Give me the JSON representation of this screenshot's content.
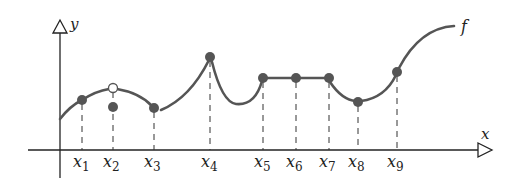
{
  "diagram": {
    "axis_labels": {
      "x": "x",
      "y": "y"
    },
    "function_label": "f",
    "points": [
      {
        "name": "x",
        "sub": "1",
        "px": 82,
        "py": 100,
        "type": "filled"
      },
      {
        "name": "x",
        "sub": "2",
        "px": 113,
        "py": 107,
        "type": "filled",
        "open_py": 88
      },
      {
        "name": "x",
        "sub": "3",
        "px": 154,
        "py": 108,
        "type": "filled"
      },
      {
        "name": "x",
        "sub": "4",
        "px": 210,
        "py": 57,
        "type": "filled"
      },
      {
        "name": "x",
        "sub": "5",
        "px": 263,
        "py": 78,
        "type": "filled"
      },
      {
        "name": "x",
        "sub": "6",
        "px": 296,
        "py": 78,
        "type": "filled"
      },
      {
        "name": "x",
        "sub": "7",
        "px": 329,
        "py": 78,
        "type": "filled"
      },
      {
        "name": "x",
        "sub": "8",
        "px": 358,
        "py": 102,
        "type": "filled"
      },
      {
        "name": "x",
        "sub": "9",
        "px": 397,
        "py": 72,
        "type": "filled"
      }
    ],
    "colors": {
      "curve": "#555555",
      "axis": "#222222",
      "point": "#555555"
    }
  }
}
